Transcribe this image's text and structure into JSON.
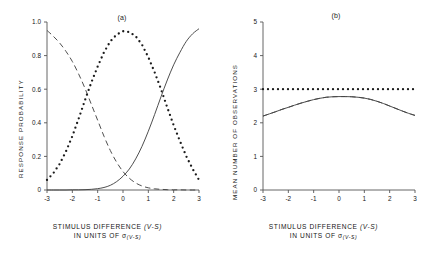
{
  "figure": {
    "panels": [
      {
        "id": "a",
        "label": "(a)",
        "ylabel": "RESPONSE   PROBABILITY",
        "caption_line1": "STIMULUS   DIFFERENCE",
        "caption_var1": "(V-S)",
        "caption_line2": "IN  UNITS  OF",
        "caption_sigma": "σ",
        "caption_sigma_sub": "(V-S)",
        "yticks": [
          "0",
          "0.2",
          "0.4",
          "0.6",
          "0.8",
          "1.0"
        ],
        "xticks": [
          "-3",
          "-2",
          "-1",
          "0",
          "1",
          "2",
          "3"
        ]
      },
      {
        "id": "b",
        "label": "(b)",
        "ylabel": "MEAN  NUMBER  OF   OBSERVATIONS",
        "caption_line1": "STIMULUS   DIFFERENCE",
        "caption_var1": "(V-S)",
        "caption_line2": "IN  UNITS  OF",
        "caption_sigma": "σ",
        "caption_sigma_sub": "(V-S)",
        "yticks": [
          "0",
          "1",
          "2",
          "3",
          "4",
          "5"
        ],
        "xticks": [
          "-3",
          "-2",
          "-1",
          "0",
          "1",
          "2",
          "3"
        ]
      }
    ]
  },
  "chart_data": [
    {
      "type": "line",
      "panel": "a",
      "title": "(a)",
      "xlabel": "STIMULUS DIFFERENCE (V-S) IN UNITS OF σ(V-S)",
      "ylabel": "RESPONSE PROBABILITY",
      "xlim": [
        -3,
        3
      ],
      "ylim": [
        0,
        1.0
      ],
      "grid": false,
      "legend": "none",
      "x": [
        -3,
        -2.75,
        -2.5,
        -2.25,
        -2,
        -1.75,
        -1.5,
        -1.25,
        -1,
        -0.75,
        -0.5,
        -0.25,
        0,
        0.25,
        0.5,
        0.75,
        1,
        1.25,
        1.5,
        1.75,
        2,
        2.25,
        2.5,
        2.75,
        3
      ],
      "series": [
        {
          "name": "decreasing-dashed",
          "style": "dashed",
          "values": [
            0.95,
            0.915,
            0.875,
            0.825,
            0.765,
            0.69,
            0.605,
            0.51,
            0.415,
            0.32,
            0.235,
            0.165,
            0.11,
            0.07,
            0.042,
            0.024,
            0.013,
            0.007,
            0.004,
            0.002,
            0.001,
            0.001,
            0.0,
            0.0,
            0.0
          ]
        },
        {
          "name": "middle-dotted",
          "style": "dotted",
          "values": [
            0.06,
            0.1,
            0.155,
            0.23,
            0.32,
            0.425,
            0.535,
            0.64,
            0.735,
            0.82,
            0.885,
            0.925,
            0.945,
            0.94,
            0.915,
            0.865,
            0.79,
            0.7,
            0.6,
            0.49,
            0.385,
            0.29,
            0.2,
            0.125,
            0.06
          ]
        },
        {
          "name": "increasing-solid",
          "style": "solid",
          "values": [
            0.0,
            0.0,
            0.0,
            0.0,
            0.001,
            0.001,
            0.002,
            0.004,
            0.008,
            0.015,
            0.028,
            0.05,
            0.082,
            0.125,
            0.185,
            0.26,
            0.35,
            0.45,
            0.555,
            0.655,
            0.745,
            0.82,
            0.885,
            0.93,
            0.96
          ]
        }
      ]
    },
    {
      "type": "line",
      "panel": "b",
      "title": "(b)",
      "xlabel": "STIMULUS DIFFERENCE (V-S) IN UNITS OF σ(V-S)",
      "ylabel": "MEAN NUMBER OF OBSERVATIONS",
      "xlim": [
        -3,
        3
      ],
      "ylim": [
        0,
        5
      ],
      "grid": false,
      "legend": "none",
      "x": [
        -3,
        -2.75,
        -2.5,
        -2.25,
        -2,
        -1.75,
        -1.5,
        -1.25,
        -1,
        -0.75,
        -0.5,
        -0.25,
        0,
        0.25,
        0.5,
        0.75,
        1,
        1.25,
        1.5,
        1.75,
        2,
        2.25,
        2.5,
        2.75,
        3
      ],
      "series": [
        {
          "name": "constant-dotted",
          "style": "dotted",
          "values": [
            3,
            3,
            3,
            3,
            3,
            3,
            3,
            3,
            3,
            3,
            3,
            3,
            3,
            3,
            3,
            3,
            3,
            3,
            3,
            3,
            3,
            3,
            3,
            3,
            3
          ]
        },
        {
          "name": "peaked-dashed",
          "style": "dashed",
          "values": [
            2.2,
            2.265,
            2.33,
            2.4,
            2.46,
            2.525,
            2.585,
            2.64,
            2.69,
            2.73,
            2.76,
            2.775,
            2.78,
            2.78,
            2.775,
            2.76,
            2.735,
            2.695,
            2.64,
            2.575,
            2.5,
            2.425,
            2.35,
            2.28,
            2.22
          ]
        },
        {
          "name": "peaked-solid",
          "style": "solid",
          "values": [
            2.2,
            2.265,
            2.33,
            2.4,
            2.46,
            2.525,
            2.585,
            2.64,
            2.69,
            2.73,
            2.76,
            2.775,
            2.78,
            2.78,
            2.775,
            2.76,
            2.735,
            2.695,
            2.64,
            2.575,
            2.5,
            2.425,
            2.35,
            2.28,
            2.22
          ]
        }
      ]
    }
  ]
}
